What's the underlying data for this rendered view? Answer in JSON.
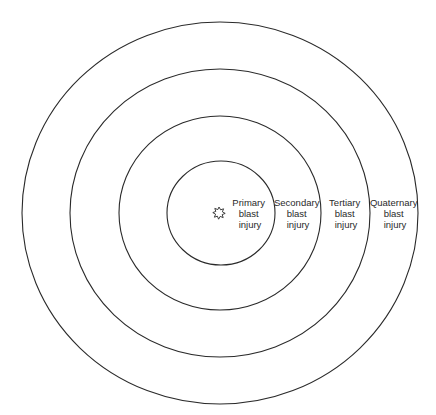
{
  "diagram": {
    "center": {
      "x": 220,
      "y": 213
    },
    "source_icon": "explosion-icon",
    "zones": [
      {
        "id": "primary",
        "lines": [
          "Primary",
          "blast",
          "injury"
        ],
        "rx": 54,
        "ry": 52,
        "label_x": 250
      },
      {
        "id": "secondary",
        "lines": [
          "Secondary",
          "blast",
          "injury"
        ],
        "rx": 101,
        "ry": 97,
        "label_x": 298
      },
      {
        "id": "tertiary",
        "lines": [
          "Tertiary",
          "blast",
          "injury"
        ],
        "rx": 150,
        "ry": 144,
        "label_x": 346
      },
      {
        "id": "quaternary",
        "lines": [
          "Quaternary",
          "blast",
          "injury"
        ],
        "rx": 198,
        "ry": 191,
        "label_x": 395
      }
    ],
    "colors": {
      "stroke": "#2a2a2a",
      "background": "#ffffff"
    }
  }
}
